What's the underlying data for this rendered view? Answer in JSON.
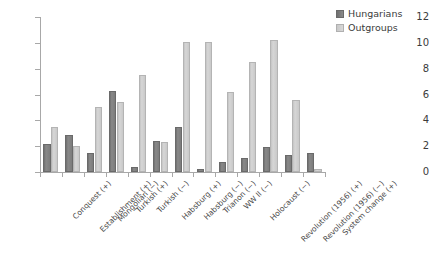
{
  "chart_data": {
    "type": "bar",
    "title": "",
    "subtitle": "",
    "xlabel": "",
    "ylabel": "",
    "ylim": [
      0,
      12
    ],
    "yticks": [
      0,
      2,
      4,
      6,
      8,
      10,
      12
    ],
    "grid": false,
    "legend_position": "top-right",
    "categories": [
      "Conquest (+)",
      "Establishment (+)",
      "Mongolian (−)",
      "Turkish (+)",
      "Turkish (−)",
      "Habsburg (+)",
      "Habsburg (−)",
      "Trianon (−)",
      "WW II (−)",
      "Holocaust (−)",
      "Revolution (1956) (+)",
      "Revolution (1956) (−)",
      "System change (+)"
    ],
    "series": [
      {
        "name": "Hungarians",
        "color": "#7a7a7a",
        "values": [
          2.15,
          2.85,
          1.45,
          6.3,
          0.4,
          2.4,
          3.45,
          0.25,
          0.8,
          1.1,
          1.9,
          1.3,
          1.5
        ]
      },
      {
        "name": "Outgroups",
        "color": "#cccccc",
        "values": [
          3.5,
          2.0,
          5.0,
          5.4,
          7.5,
          2.35,
          10.1,
          10.1,
          6.2,
          8.5,
          10.2,
          5.6,
          0.25
        ]
      }
    ]
  },
  "legend": {
    "items": [
      {
        "label": "Hungarians",
        "color": "#7a7a7a"
      },
      {
        "label": "Outgroups",
        "color": "#cccccc"
      }
    ]
  },
  "axes": {
    "y_tick_labels": [
      "12",
      "10",
      "8",
      "6",
      "4",
      "2",
      "0"
    ]
  }
}
